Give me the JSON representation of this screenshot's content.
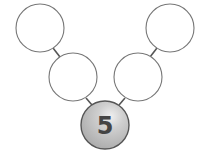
{
  "diagram": {
    "type": "number-bond-tree",
    "root": {
      "value": "5",
      "fill": "#c4c4c4",
      "stroke": "#555555"
    },
    "nodes": [
      {
        "id": "top-left",
        "value": ""
      },
      {
        "id": "middle-left",
        "value": ""
      },
      {
        "id": "middle-right",
        "value": ""
      },
      {
        "id": "top-right",
        "value": ""
      }
    ],
    "colors": {
      "node_fill": "#ffffff",
      "node_stroke": "#777777",
      "text": "#444444"
    }
  }
}
